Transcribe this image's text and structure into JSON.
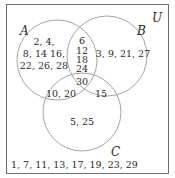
{
  "universe_label": "U",
  "sets": {
    "A": {
      "label": "A"
    },
    "B": {
      "label": "B"
    },
    "C": {
      "label": "C"
    }
  },
  "regions": {
    "A_only": {
      "lines": [
        "2, 4,",
        "8, 14 16,",
        "22, 26, 28"
      ]
    },
    "B_only": {
      "lines": [
        "3, 9, 21, 27"
      ]
    },
    "C_only": {
      "lines": [
        "5, 25"
      ]
    },
    "A_and_B_only": {
      "lines": [
        "6",
        "12",
        "18",
        "24"
      ]
    },
    "A_and_C_only": {
      "lines": [
        "10, 20"
      ]
    },
    "B_and_C_only": {
      "lines": [
        "15"
      ]
    },
    "A_and_B_and_C": {
      "lines": [
        "30"
      ]
    },
    "outside": {
      "lines": [
        "1, 7, 11, 13, 17, 19, 23, 29"
      ]
    }
  },
  "colors": {
    "circle_stroke": "#9a9a9a",
    "box_stroke": "#6f6f6f",
    "text": "#2a2a2a"
  }
}
